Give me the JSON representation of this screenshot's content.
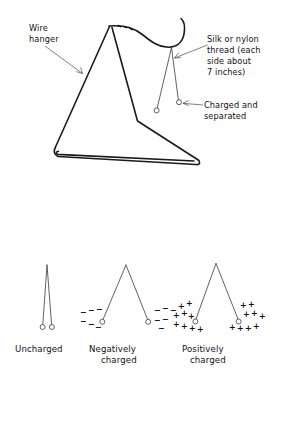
{
  "figure": {
    "background_color": "#ffffff",
    "ink_color": "#1a1a1a",
    "thread_color": "#3a3a3a"
  },
  "top_diagram": {
    "labels": {
      "wire_hanger": {
        "lines": [
          "Wire",
          "hanger"
        ],
        "line1": "Wire",
        "line2": "hanger"
      },
      "silk_thread": {
        "lines": [
          "Silk or nylon",
          "thread (each",
          "side about",
          "7 inches)"
        ],
        "line1": "Silk or nylon",
        "line2": "thread (each",
        "line3": "side about",
        "line4": "7 inches)"
      },
      "charged_separated": {
        "lines": [
          "Charged and",
          "separated"
        ],
        "line1": "Charged and",
        "line2": "separated"
      }
    }
  },
  "bottom_diagrams": [
    {
      "id": "uncharged",
      "label_lines": [
        "Uncharged"
      ],
      "label_line1": "Uncharged",
      "label_line2": "",
      "charge_symbol": "",
      "charge_count": 0,
      "thread_spread": "closed"
    },
    {
      "id": "negatively-charged",
      "label_lines": [
        "Negatively",
        "charged"
      ],
      "label_line1": "Negatively",
      "label_line2": "charged",
      "charge_symbol": "−",
      "charge_count": 12,
      "thread_spread": "open"
    },
    {
      "id": "positively-charged",
      "label_lines": [
        "Positively",
        "charged"
      ],
      "label_line1": "Positively",
      "label_line2": "charged",
      "charge_symbol": "+",
      "charge_count": 18,
      "thread_spread": "open"
    }
  ]
}
